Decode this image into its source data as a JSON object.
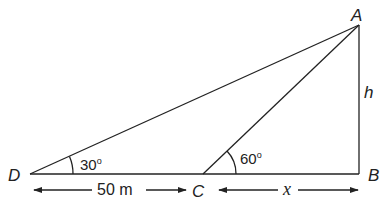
{
  "diagram": {
    "type": "geometry-heights-and-distances",
    "points": {
      "A": {
        "label": "A",
        "x": 359,
        "y": 25
      },
      "B": {
        "label": "B",
        "x": 359,
        "y": 174
      },
      "C": {
        "label": "C",
        "x": 203,
        "y": 174
      },
      "D": {
        "label": "D",
        "x": 30,
        "y": 174
      }
    },
    "segments": [
      "DA",
      "CA",
      "AB",
      "DB"
    ],
    "angles": {
      "at_D": {
        "label": "30o",
        "degrees": 30
      },
      "at_C": {
        "label": "60o",
        "degrees": 60
      }
    },
    "lengths": {
      "AB": {
        "label": "h"
      },
      "DC": {
        "label": "50 m"
      },
      "CB": {
        "label": "x"
      }
    }
  }
}
